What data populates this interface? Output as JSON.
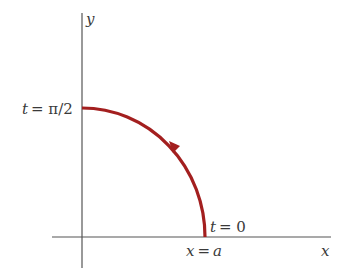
{
  "diagram": {
    "colors": {
      "axis": "#555555",
      "curve": "#a31f1f",
      "text": "#3a3a3a",
      "background": "#ffffff"
    },
    "axes": {
      "x_label": "x",
      "y_label": "y"
    },
    "curve": {
      "description": "quarter circle traversed counterclockwise from t=0 to t=π/2",
      "start_label": "t = 0",
      "start_point_label": "x = a",
      "end_label": "t = π/2",
      "direction": "counterclockwise"
    },
    "labels": {
      "y_axis": "y",
      "x_axis": "x",
      "t_end_var": "t",
      "t_end_eq": "= π/2",
      "t_start_var": "t",
      "t_start_eq": "= 0",
      "xa_var": "x",
      "xa_eq": "=",
      "xa_val": "a"
    }
  }
}
